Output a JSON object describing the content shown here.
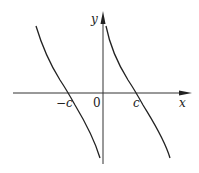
{
  "diagram": {
    "axes": {
      "x_label": "x",
      "y_label": "y",
      "origin_label": "0"
    },
    "ticks": {
      "neg_c": "−c",
      "pos_c": "c"
    },
    "branches": [
      {
        "name": "left-branch",
        "x_intercept": "-c",
        "behavior": "decreasing, tends to -infinity as x approaches 0 from the left"
      },
      {
        "name": "right-branch",
        "x_intercept": "c",
        "behavior": "decreasing, tends to +infinity as x approaches 0 from the right"
      }
    ],
    "colors": {
      "line": "#222222",
      "background": "#ffffff"
    }
  }
}
